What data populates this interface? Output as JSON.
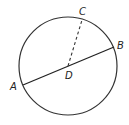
{
  "diagram": {
    "type": "circle-geometry",
    "circle": {
      "cx": 68,
      "cy": 66,
      "r": 49,
      "stroke": "#333333"
    },
    "points": [
      {
        "id": "A",
        "label": "A",
        "x": 23,
        "y": 85,
        "lx": 10,
        "ly": 90
      },
      {
        "id": "B",
        "label": "B",
        "x": 114,
        "y": 47,
        "lx": 117,
        "ly": 49
      },
      {
        "id": "C",
        "label": "C",
        "x": 82,
        "y": 20,
        "lx": 80,
        "ly": 15
      },
      {
        "id": "D",
        "label": "D",
        "x": 68,
        "y": 66,
        "lx": 65,
        "ly": 79
      }
    ],
    "segments": [
      {
        "from": "A",
        "to": "B",
        "style": "solid"
      },
      {
        "from": "D",
        "to": "C",
        "style": "dashed"
      }
    ]
  }
}
